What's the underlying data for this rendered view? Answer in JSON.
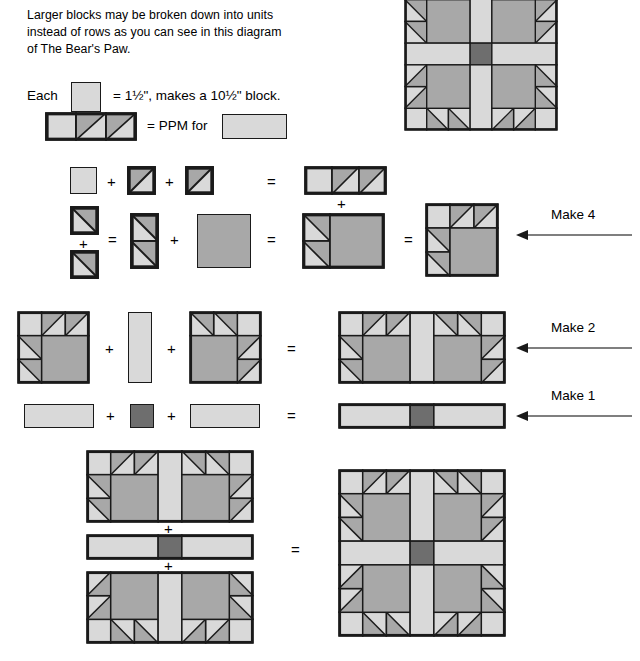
{
  "document": {
    "type": "quilting-instruction-diagram",
    "title_subject": "The Bear's Paw"
  },
  "intro": {
    "paragraph": "Larger blocks may be broken down into units\ninstead of rows as you can see in this diagram\nof The Bear's Paw."
  },
  "legend": {
    "each_label": "Each",
    "each_equals": "= 1½\", makes a 10½\" block.",
    "ppm_equals": "= PPM for"
  },
  "operators": {
    "plus": "+",
    "equals": "="
  },
  "arrows": [
    {
      "label": "Make 4"
    },
    {
      "label": "Make 2"
    },
    {
      "label": "Make 1"
    }
  ],
  "colors": {
    "light": "#d9d9d9",
    "medium": "#a8a8a8",
    "dark": "#6e6e6e",
    "outline": "#1a1a1a",
    "background": "#ffffff",
    "arrow_line": "#555555"
  },
  "rows": {
    "row_hst_strip": {
      "name": "half-square-triangle strip",
      "pieces": [
        "light-square",
        "hst-square",
        "hst-square"
      ],
      "result": "three-patch-strip"
    },
    "row_paw": {
      "name": "bear paw unit assembly",
      "pieces": [
        "hst-square",
        "hst-square",
        "hst-pair-column",
        "medium-large-square"
      ],
      "result": "paw-unit",
      "make": "Make 4"
    },
    "row_make2": {
      "name": "paw pair with sashing",
      "pieces": [
        "paw-unit-left",
        "light-sashing-strip",
        "paw-unit-right"
      ],
      "result": "paw-row",
      "make": "Make 2"
    },
    "row_make1": {
      "name": "center sashing row",
      "pieces": [
        "light-rectangle",
        "dark-square",
        "light-rectangle"
      ],
      "result": "sashing-row",
      "make": "Make 1"
    },
    "row_final": {
      "name": "final block assembly",
      "pieces": [
        "paw-row-top",
        "sashing-row",
        "paw-row-bottom"
      ],
      "result": "completed-bears-paw-block"
    }
  }
}
